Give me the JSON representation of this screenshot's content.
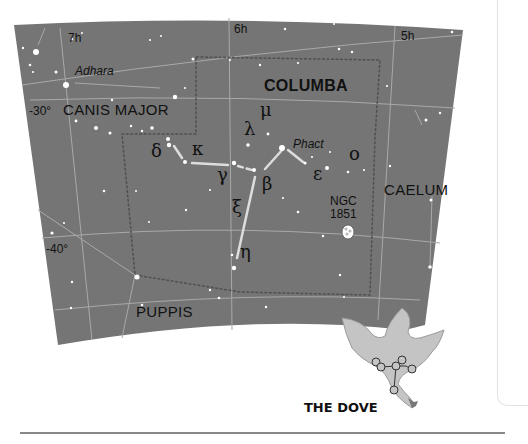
{
  "map": {
    "title": "COLUMBA",
    "caption": "THE DOVE",
    "colors": {
      "sky": "#757575",
      "grid_line": "#a9a9a9",
      "boundary": "#505050",
      "stick_figure": "#dddddd",
      "dove_fill": "#c4c4c4",
      "label": "#111111"
    },
    "hour_labels": [
      {
        "text": "7h"
      },
      {
        "text": "6h"
      },
      {
        "text": "5h"
      }
    ],
    "declination_labels": [
      {
        "text": "-30°"
      },
      {
        "text": "-40°"
      }
    ],
    "constellations": [
      {
        "name": "COLUMBA"
      },
      {
        "name": "CANIS MAJOR"
      },
      {
        "name": "CAELUM"
      },
      {
        "name": "PUPPIS"
      }
    ],
    "star_names": [
      {
        "name": "Adhara"
      },
      {
        "name": "Phact"
      }
    ],
    "greek_letters": [
      {
        "letter": "δ"
      },
      {
        "letter": "κ"
      },
      {
        "letter": "λ"
      },
      {
        "letter": "μ"
      },
      {
        "letter": "γ"
      },
      {
        "letter": "β"
      },
      {
        "letter": "ε"
      },
      {
        "letter": "ο"
      },
      {
        "letter": "ξ"
      },
      {
        "letter": "η"
      }
    ],
    "deep_sky": {
      "line1": "NGC",
      "line2": "1851"
    }
  }
}
